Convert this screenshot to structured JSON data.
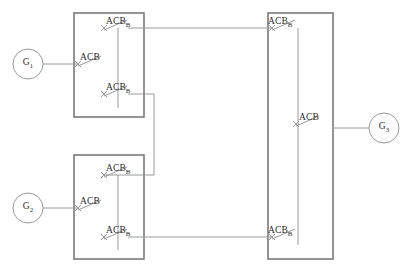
{
  "diagram": {
    "type": "electrical-single-line",
    "width": 406,
    "height": 273,
    "colors": {
      "background": "#ffffff",
      "enclosure_stroke": "#7a7a7a",
      "wire_stroke": "#9a9a9a",
      "bus_stroke": "#9a9a9a",
      "text": "#2b2b2b"
    },
    "generators": [
      {
        "id": "g1",
        "label": "G",
        "subscript": "1",
        "cx": 28,
        "cy": 64,
        "r": 15
      },
      {
        "id": "g2",
        "label": "G",
        "subscript": "2",
        "cx": 28,
        "cy": 208,
        "r": 15
      },
      {
        "id": "g3",
        "label": "G",
        "subscript": "3",
        "cx": 384,
        "cy": 128,
        "r": 15
      }
    ],
    "enclosures": [
      {
        "id": "switchgear-upper-left",
        "x": 74,
        "y": 13,
        "w": 70,
        "h": 104
      },
      {
        "id": "switchgear-lower-left",
        "x": 74,
        "y": 155,
        "w": 70,
        "h": 104
      },
      {
        "id": "switchgear-right-bus",
        "x": 268,
        "y": 13,
        "w": 65,
        "h": 246
      }
    ],
    "breakers": [
      {
        "id": "acb-g1-incomer",
        "label": "ACB",
        "subscript": "",
        "x": 78,
        "y": 64,
        "label_x": 80,
        "label_y": 53
      },
      {
        "id": "acb-b-upper-feeder",
        "label": "ACB",
        "subscript": "B",
        "x": 104,
        "y": 28,
        "label_x": 106,
        "label_y": 17
      },
      {
        "id": "acb-b-upper-tie",
        "label": "ACB",
        "subscript": "B",
        "x": 104,
        "y": 94,
        "label_x": 106,
        "label_y": 83
      },
      {
        "id": "acb-g2-incomer",
        "label": "ACB",
        "subscript": "",
        "x": 78,
        "y": 208,
        "label_x": 80,
        "label_y": 197
      },
      {
        "id": "acb-b-lower-tie",
        "label": "ACB",
        "subscript": "B",
        "x": 104,
        "y": 175,
        "label_x": 106,
        "label_y": 164
      },
      {
        "id": "acb-b-lower-feeder",
        "label": "ACB",
        "subscript": "B",
        "x": 104,
        "y": 237,
        "label_x": 106,
        "label_y": 226
      },
      {
        "id": "acb-b-bus-upper",
        "label": "ACB",
        "subscript": "B",
        "x": 272,
        "y": 28,
        "label_x": 268,
        "label_y": 17
      },
      {
        "id": "acb-g3-feeder",
        "label": "ACB",
        "subscript": "",
        "x": 296,
        "y": 124,
        "label_x": 299,
        "label_y": 113
      },
      {
        "id": "acb-b-bus-lower",
        "label": "ACB",
        "subscript": "B",
        "x": 272,
        "y": 237,
        "label_x": 268,
        "label_y": 226
      }
    ],
    "buses": [
      {
        "id": "bus-upper-left",
        "x": 118,
        "y1": 28,
        "y2": 108
      },
      {
        "id": "bus-lower-left",
        "x": 118,
        "y1": 175,
        "y2": 250
      },
      {
        "id": "bus-right",
        "x": 298,
        "y1": 28,
        "y2": 245
      }
    ],
    "connections": [
      {
        "id": "wire-g1-to-acb",
        "points": "43,64 78,64"
      },
      {
        "id": "wire-g2-to-acb",
        "points": "43,208 78,208"
      },
      {
        "id": "wire-g3-to-acb",
        "points": "333,128 369,128"
      },
      {
        "id": "wire-upper-feeder-bus",
        "points": "128,28 272,28"
      },
      {
        "id": "wire-tie-left",
        "points": "128,94 154,94 154,175 104,175"
      },
      {
        "id": "wire-lower-feeder-bus",
        "points": "128,237 272,237"
      }
    ]
  }
}
